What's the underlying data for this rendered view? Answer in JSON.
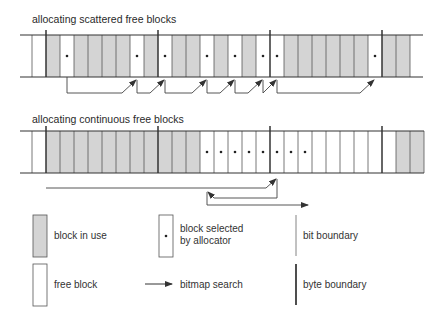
{
  "row1": {
    "title": "allocating scattered free blocks",
    "blocks": [
      "free",
      "used",
      "sel",
      "used",
      "used",
      "used",
      "used",
      "sel",
      "used",
      "sel",
      "used",
      "used",
      "sel",
      "used",
      "sel",
      "used",
      "sel",
      "sel",
      "used",
      "used",
      "used",
      "used",
      "used",
      "used",
      "sel",
      "used",
      "used"
    ]
  },
  "row2": {
    "title": "allocating continuous free blocks",
    "blocks": [
      "free",
      "used",
      "used",
      "used",
      "used",
      "used",
      "used",
      "used",
      "used",
      "used",
      "used",
      "used",
      "sel",
      "sel",
      "sel",
      "sel",
      "sel",
      "sel",
      "sel",
      "sel",
      "free",
      "free",
      "free",
      "free",
      "free",
      "free",
      "used",
      "used"
    ]
  },
  "legend": {
    "used": "block in use",
    "free": "free block",
    "selected_line1": "block selected",
    "selected_line2": "by allocator",
    "search": "bitmap search",
    "bit": "bit boundary",
    "byte": "byte boundary"
  },
  "colors": {
    "used_fill": "#d4d4d4",
    "line": "#555555",
    "byte_line": "#333333"
  }
}
